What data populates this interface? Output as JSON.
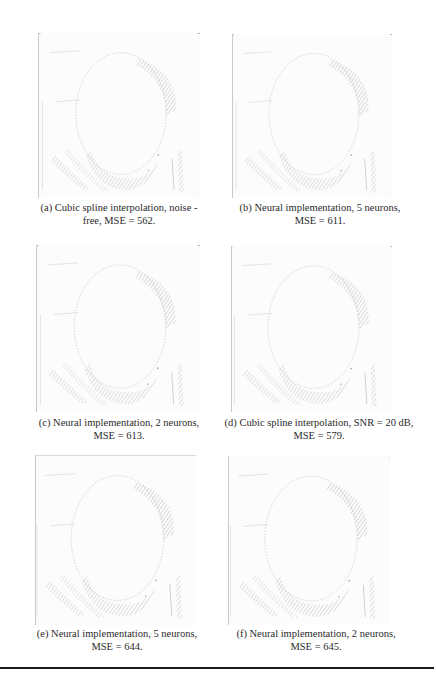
{
  "figure": {
    "panels": [
      {
        "id": "a",
        "caption_line1": "(a) Cubic spline interpolation, noise -",
        "caption_line2": "free, MSE = 562."
      },
      {
        "id": "b",
        "caption_line1": "(b) Neural implementation, 5 neurons,",
        "caption_line2": "MSE = 611."
      },
      {
        "id": "c",
        "caption_line1": "(c) Neural implementation, 2 neurons,",
        "caption_line2": "MSE = 613."
      },
      {
        "id": "d",
        "caption_line1": "(d) Cubic spline interpolation, SNR = 20 dB,",
        "caption_line2": "MSE = 579."
      },
      {
        "id": "e",
        "caption_line1": "(e) Neural implementation, 5 neurons,",
        "caption_line2": "MSE = 644."
      },
      {
        "id": "f",
        "caption_line1": "(f) Neural implementation, 2 neurons,",
        "caption_line2": "MSE = 645."
      }
    ],
    "edge_color": "#9a9a9a",
    "rule_color": "#1a1a1a"
  }
}
